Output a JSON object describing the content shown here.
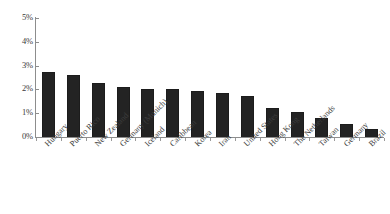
{
  "chart_data": {
    "type": "bar",
    "title": "",
    "subtitle": "",
    "xlabel": "",
    "ylabel": "",
    "ylim": [
      0,
      5
    ],
    "ytick_labels": [
      "0%",
      "1%",
      "2%",
      "3%",
      "4%",
      "5%"
    ],
    "ytick_values": [
      0,
      1,
      2,
      3,
      4,
      5
    ],
    "grid": false,
    "legend": null,
    "bar_color": "#1c1c1c",
    "axis_color": "#8d8d8d",
    "background": "#ffffff",
    "categories": [
      "Hungary",
      "Puerto Rico",
      "New Zealand",
      "Germany (Munich)",
      "Iceland",
      "Caribbean",
      "Korea",
      "Iran",
      "United States",
      "Hong Kong",
      "The Netherlands",
      "Taiwan",
      "Germany",
      "Brazil"
    ],
    "values": [
      2.75,
      2.6,
      2.25,
      2.12,
      2.0,
      2.0,
      1.95,
      1.85,
      1.72,
      1.2,
      1.05,
      0.78,
      0.55,
      0.35
    ],
    "value_unit": "%"
  }
}
